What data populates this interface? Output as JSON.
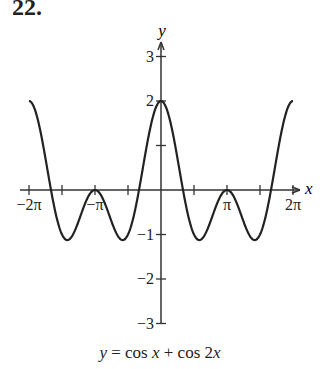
{
  "problem_number": "22.",
  "chart_data": {
    "type": "line",
    "title": "y = cos x + cos 2x",
    "function": "cos(x) + cos(2x)",
    "xlabel": "x",
    "ylabel": "y",
    "xlim": [
      -6.2832,
      6.2832
    ],
    "ylim": [
      -3,
      3
    ],
    "x_ticks": [
      -6.2832,
      -4.7124,
      -3.1416,
      -1.5708,
      0,
      1.5708,
      3.1416,
      4.7124,
      6.2832
    ],
    "x_tick_labels": [
      {
        "value": -6.2832,
        "label": "−2π"
      },
      {
        "value": -3.1416,
        "label": "−π"
      },
      {
        "value": 3.1416,
        "label": "π"
      },
      {
        "value": 6.2832,
        "label": "2π"
      }
    ],
    "y_ticks": [
      -3,
      -2,
      -1,
      1,
      2,
      3
    ],
    "y_tick_labels": [
      "−3",
      "−2",
      "−1",
      "2",
      "3"
    ],
    "key_points": [
      {
        "x": -6.2832,
        "y": 2
      },
      {
        "x": -4.4286,
        "y": -1.125
      },
      {
        "x": -3.1416,
        "y": 0
      },
      {
        "x": -1.8546,
        "y": -1.125
      },
      {
        "x": 0,
        "y": 2
      },
      {
        "x": 1.8546,
        "y": -1.125
      },
      {
        "x": 3.1416,
        "y": 0
      },
      {
        "x": 4.4286,
        "y": -1.125
      },
      {
        "x": 6.2832,
        "y": 2
      }
    ],
    "grid": false,
    "legend": null
  },
  "labels": {
    "y_axis": "y",
    "x_axis": "x",
    "caption_y": "y",
    "caption_eq": " = cos ",
    "caption_x1": "x",
    "caption_plus": " + cos 2",
    "caption_x2": "x"
  }
}
